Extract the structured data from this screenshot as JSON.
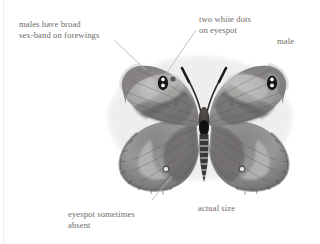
{
  "figure": {
    "rendering": "grayscale",
    "background_color": "#ffffff",
    "text_color": "#6e6b68",
    "leader_line_color": "#b9b6b3"
  },
  "labels": {
    "sex_band": "males have broad\nsex-band on forewings",
    "white_dots": "two white dots\non eyespot",
    "sex": "male",
    "eyespot_absent": "eyespot sometimes\nabsent",
    "scale": "actual size"
  },
  "specimen": {
    "parts": [
      "left-forewing",
      "right-forewing",
      "left-hindwing",
      "right-hindwing",
      "thorax",
      "abdomen",
      "left-antenna",
      "right-antenna"
    ],
    "markings": {
      "forewing_eyespots": 2,
      "white_dots_per_eyespot": 2,
      "hindwing_white_dots": 2
    },
    "colors": {
      "wing_mid": "#9a9896",
      "wing_light": "#c3c1bf",
      "wing_dark": "#6f6d6b",
      "wing_darkest": "#454342",
      "eyespot": "#151414",
      "eyespot_dot": "#ffffff",
      "body": "#3a3836",
      "halo": "#e6e4e2"
    }
  }
}
